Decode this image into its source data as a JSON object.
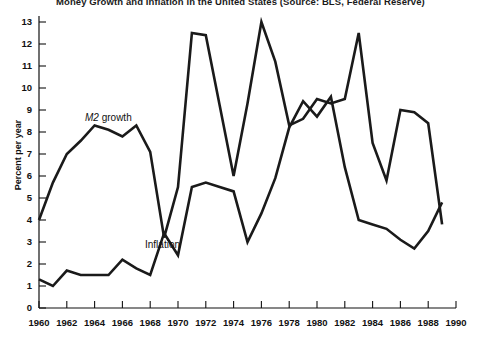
{
  "chart_data": {
    "type": "line",
    "title": "Money Growth and Inflation in the United States (Source: BLS, Federal Reserve)",
    "xlabel": "",
    "ylabel": "Percent per year",
    "xlim": [
      1960,
      1990
    ],
    "ylim": [
      0,
      13
    ],
    "ytick_labels": [
      "0",
      "1",
      "2",
      "3",
      "4",
      "5",
      "6",
      "7",
      "8",
      "9",
      "10",
      "11",
      "12",
      "13"
    ],
    "yticks": [
      0,
      1,
      2,
      3,
      4,
      5,
      6,
      7,
      8,
      9,
      10,
      11,
      12,
      13
    ],
    "xtick_labels": [
      "1960",
      "1962",
      "1964",
      "1966",
      "1968",
      "1970",
      "1972",
      "1974",
      "1976",
      "1978",
      "1980",
      "1982",
      "1984",
      "1986",
      "1988",
      "1990"
    ],
    "xticks": [
      1960,
      1962,
      1964,
      1966,
      1968,
      1970,
      1972,
      1974,
      1976,
      1978,
      1980,
      1982,
      1984,
      1986,
      1988,
      1990
    ],
    "grid": false,
    "legend_position": "inline-annotation",
    "line_color": "#1a1a1a",
    "line_width": 2.6,
    "x": [
      1960,
      1961,
      1962,
      1963,
      1964,
      1965,
      1966,
      1967,
      1968,
      1969,
      1970,
      1971,
      1972,
      1973,
      1974,
      1975,
      1976,
      1977,
      1978,
      1979,
      1980,
      1981,
      1982,
      1983,
      1984,
      1985,
      1986,
      1987,
      1988,
      1989
    ],
    "series": [
      {
        "name": "M2 growth",
        "label": "M2 growth",
        "label_italic_prefix": "M2",
        "label_rest": " growth",
        "values": [
          4.0,
          5.7,
          7.0,
          7.6,
          8.3,
          8.1,
          7.8,
          8.3,
          7.1,
          3.2,
          5.5,
          12.5,
          12.4,
          9.2,
          6.0,
          9.3,
          13.0,
          11.2,
          8.3,
          8.6,
          9.5,
          9.3,
          9.5,
          12.5,
          7.5,
          5.8,
          9.0,
          8.9,
          8.4,
          3.8
        ]
      },
      {
        "name": "Inflation",
        "label": "Inflation",
        "values": [
          1.3,
          1.0,
          1.7,
          1.5,
          1.5,
          1.5,
          2.2,
          1.8,
          1.5,
          3.4,
          2.4,
          5.5,
          5.7,
          5.5,
          5.3,
          3.0,
          4.3,
          5.9,
          8.2,
          9.4,
          8.7,
          9.6,
          6.4,
          4.0,
          3.8,
          3.6,
          3.1,
          2.7,
          3.5,
          4.8
        ]
      }
    ]
  }
}
